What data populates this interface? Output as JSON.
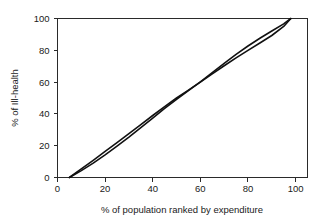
{
  "chart_data": {
    "type": "line",
    "title": "",
    "subtitle": "",
    "xlabel": "% of population ranked by expenditure",
    "ylabel": "% of Ill-health",
    "xlim": [
      0,
      105
    ],
    "ylim": [
      0,
      100
    ],
    "xticks": [
      0,
      20,
      40,
      60,
      80,
      100
    ],
    "yticks": [
      0,
      20,
      40,
      60,
      80,
      100
    ],
    "xtick_labels": [
      "0",
      "20",
      "40",
      "60",
      "80",
      "100"
    ],
    "ytick_labels": [
      "0",
      "20",
      "40",
      "60",
      "80",
      "100"
    ],
    "grid": false,
    "legend": false,
    "legend_position": "none",
    "annotations": [],
    "series": [
      {
        "name": "curve-upper-lower-half",
        "color": "#111111",
        "x": [
          5,
          10,
          15,
          20,
          25,
          30,
          35,
          40,
          45,
          50,
          55,
          57,
          60,
          65,
          70,
          75,
          80,
          85,
          90,
          95,
          98
        ],
        "y": [
          0,
          5.4,
          10.8,
          16.4,
          22.0,
          27.6,
          33.3,
          39.0,
          44.6,
          50.0,
          55.0,
          57.0,
          60.0,
          65.2,
          70.3,
          75.2,
          80.0,
          84.6,
          89.3,
          95.0,
          100
        ]
      },
      {
        "name": "curve-lower-upper-half",
        "color": "#111111",
        "x": [
          5,
          10,
          15,
          20,
          25,
          30,
          35,
          40,
          45,
          50,
          55,
          57,
          60,
          65,
          70,
          75,
          80,
          85,
          90,
          95,
          98
        ],
        "y": [
          0,
          4.3,
          9.0,
          14.2,
          19.7,
          25.4,
          31.4,
          37.4,
          43.4,
          49.2,
          54.6,
          56.8,
          60.2,
          66.0,
          71.8,
          77.4,
          82.7,
          87.6,
          92.1,
          96.6,
          100
        ]
      }
    ]
  },
  "figure": {
    "background_color": "#ffffff",
    "line_color": "#111111",
    "axis_color": "#2a2a2a"
  }
}
